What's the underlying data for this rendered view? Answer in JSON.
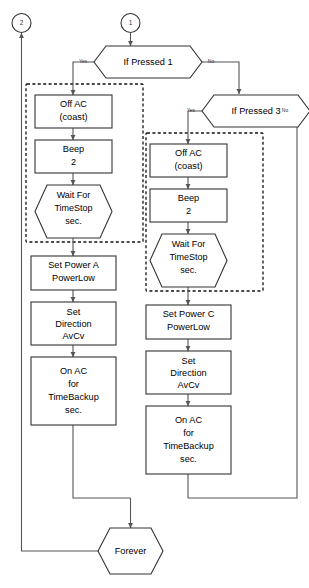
{
  "diagram": {
    "type": "flowchart",
    "colors": {
      "background": "#ffffff",
      "shape_stroke": "#333333",
      "connector": "#555555",
      "dashed_group": "#111111",
      "text": "#000000"
    },
    "connectors": [
      {
        "id": "conn-in-1",
        "label": "1"
      },
      {
        "id": "conn-out-2",
        "label": "2"
      }
    ],
    "decisions": [
      {
        "id": "dec-if-pressed-1",
        "label": "If Pressed 1",
        "yes": "Yes",
        "no": "No"
      },
      {
        "id": "dec-if-pressed-3",
        "label": "If Pressed 3",
        "yes": "Yes",
        "no": "No"
      }
    ],
    "left_branch": {
      "dashed_group_label": "",
      "steps": [
        {
          "id": "left-off-ac",
          "shape": "process",
          "lines": [
            "Off AC",
            "(coast)"
          ]
        },
        {
          "id": "left-beep",
          "shape": "process",
          "lines": [
            "Beep",
            "2"
          ]
        },
        {
          "id": "left-wait",
          "shape": "hexagon",
          "lines": [
            "Wait  For",
            "TimeStop",
            "sec."
          ]
        },
        {
          "id": "left-set-power",
          "shape": "process",
          "lines": [
            "Set Power A",
            "PowerLow"
          ]
        },
        {
          "id": "left-set-direction",
          "shape": "process",
          "lines": [
            "Set",
            "Direction",
            "AvCv"
          ]
        },
        {
          "id": "left-on-ac",
          "shape": "process",
          "lines": [
            "On AC",
            "for",
            "TimeBackup",
            "sec."
          ]
        }
      ]
    },
    "right_branch": {
      "dashed_group_label": "",
      "steps": [
        {
          "id": "right-off-ac",
          "shape": "process",
          "lines": [
            "Off AC",
            "(coast)"
          ]
        },
        {
          "id": "right-beep",
          "shape": "process",
          "lines": [
            "Beep",
            "2"
          ]
        },
        {
          "id": "right-wait",
          "shape": "hexagon",
          "lines": [
            "Wait For",
            "TimeStop",
            "sec."
          ]
        },
        {
          "id": "right-set-power",
          "shape": "process",
          "lines": [
            "Set Power C",
            "PowerLow"
          ]
        },
        {
          "id": "right-set-direction",
          "shape": "process",
          "lines": [
            "Set",
            "Direction",
            "AvCv"
          ]
        },
        {
          "id": "right-on-ac",
          "shape": "process",
          "lines": [
            "On AC",
            "for",
            "TimeBackup",
            "sec."
          ]
        }
      ]
    },
    "terminator": {
      "id": "node-forever",
      "shape": "hexagon",
      "label": "Forever"
    }
  }
}
